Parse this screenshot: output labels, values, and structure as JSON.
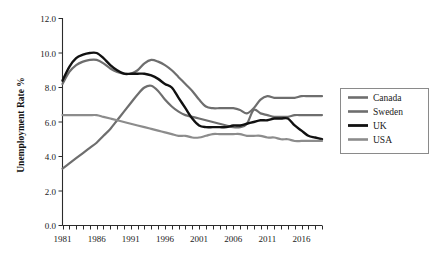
{
  "chart_data": {
    "type": "line",
    "title": "",
    "xlabel": "",
    "ylabel": "Unemployment Rate %",
    "xlim": [
      1981,
      2019
    ],
    "ylim": [
      0.0,
      12.0
    ],
    "grid": false,
    "legend_position": "right",
    "y_ticks": [
      "0.0",
      "2.0",
      "4.0",
      "6.0",
      "8.0",
      "10.0",
      "12.0"
    ],
    "y_tick_values": [
      0.0,
      2.0,
      4.0,
      6.0,
      8.0,
      10.0,
      12.0
    ],
    "x_ticks": [
      "1981",
      "1986",
      "1991",
      "1996",
      "2001",
      "2006",
      "2011",
      "2016"
    ],
    "x_tick_values": [
      1981,
      1986,
      1991,
      1996,
      2001,
      2006,
      2011,
      2016
    ],
    "x_minor_tick_interval": 1,
    "x": [
      1981,
      1982,
      1983,
      1984,
      1985,
      1986,
      1987,
      1988,
      1989,
      1990,
      1991,
      1992,
      1993,
      1994,
      1995,
      1996,
      1997,
      1998,
      1999,
      2000,
      2001,
      2002,
      2003,
      2004,
      2005,
      2006,
      2007,
      2008,
      2009,
      2010,
      2011,
      2012,
      2013,
      2014,
      2015,
      2016,
      2017,
      2018,
      2019
    ],
    "series": [
      {
        "name": "Canada",
        "color": "#6e6e6e",
        "width": 2.2,
        "values": [
          3.3,
          3.6,
          3.9,
          4.2,
          4.5,
          4.8,
          5.2,
          5.6,
          6.1,
          6.6,
          7.1,
          7.6,
          8.0,
          8.1,
          7.8,
          7.3,
          6.9,
          6.6,
          6.4,
          6.3,
          6.2,
          6.1,
          6.0,
          5.9,
          5.8,
          5.7,
          5.7,
          5.9,
          6.7,
          6.5,
          6.4,
          6.3,
          6.3,
          6.3,
          6.4,
          6.4,
          6.4,
          6.4,
          6.4
        ],
        "endpoint_value": 6.4
      },
      {
        "name": "Sweden",
        "color": "#6e6e6e",
        "width": 2.2,
        "values": [
          8.2,
          8.9,
          9.3,
          9.5,
          9.6,
          9.6,
          9.4,
          9.1,
          8.9,
          8.8,
          8.8,
          9.0,
          9.4,
          9.6,
          9.5,
          9.3,
          9.0,
          8.6,
          8.2,
          7.8,
          7.3,
          6.9,
          6.8,
          6.8,
          6.8,
          6.8,
          6.7,
          6.5,
          6.8,
          7.3,
          7.5,
          7.4,
          7.4,
          7.4,
          7.4,
          7.5,
          7.5,
          7.5,
          7.5
        ],
        "endpoint_value": 7.5
      },
      {
        "name": "UK",
        "color": "#111111",
        "width": 2.4,
        "values": [
          8.4,
          9.2,
          9.7,
          9.9,
          10.0,
          10.0,
          9.7,
          9.3,
          9.0,
          8.8,
          8.8,
          8.8,
          8.8,
          8.7,
          8.5,
          8.2,
          8.0,
          7.4,
          6.8,
          6.2,
          5.8,
          5.7,
          5.7,
          5.7,
          5.7,
          5.8,
          5.8,
          5.9,
          6.0,
          6.1,
          6.1,
          6.2,
          6.2,
          6.2,
          5.8,
          5.5,
          5.2,
          5.1,
          5.0
        ],
        "endpoint_value": 5.0
      },
      {
        "name": "USA",
        "color": "#8c8c8c",
        "width": 2.2,
        "values": [
          6.4,
          6.4,
          6.4,
          6.4,
          6.4,
          6.4,
          6.3,
          6.2,
          6.1,
          6.0,
          5.9,
          5.8,
          5.7,
          5.6,
          5.5,
          5.4,
          5.3,
          5.2,
          5.2,
          5.1,
          5.1,
          5.2,
          5.3,
          5.3,
          5.3,
          5.3,
          5.3,
          5.2,
          5.2,
          5.2,
          5.1,
          5.1,
          5.0,
          5.0,
          4.9,
          4.9,
          4.9,
          4.9,
          4.9
        ],
        "endpoint_value": 4.9
      }
    ]
  },
  "legend": {
    "items": [
      {
        "label": "Canada"
      },
      {
        "label": "Sweden"
      },
      {
        "label": "UK"
      },
      {
        "label": "USA"
      }
    ]
  },
  "axes": {
    "y_title": "Unemployment Rate %"
  }
}
